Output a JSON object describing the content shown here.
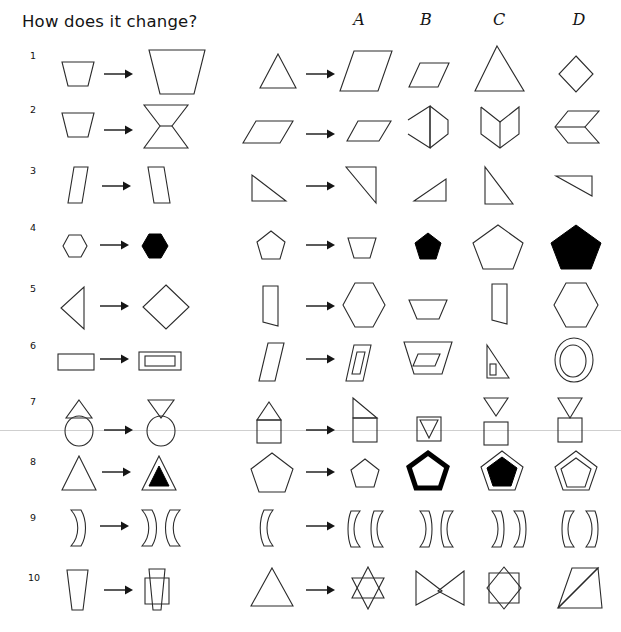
{
  "header": {
    "title": "How does it change?",
    "columns": [
      "A",
      "B",
      "C",
      "D"
    ]
  },
  "rows": [
    {
      "number": "1",
      "example": {
        "from": "small-trapezoid-narrow-top",
        "to": "large-trapezoid-narrow-top"
      },
      "question": "triangle-up",
      "options": [
        "large-parallelogram",
        "small-parallelogram",
        "tall-triangle",
        "diamond"
      ]
    },
    {
      "number": "2",
      "example": {
        "from": "trapezoid-narrow-bottom",
        "to": "hourglass-bowtie-vertical"
      },
      "question": "parallelogram-flat",
      "options": [
        "parallelogram-flat-small",
        "folded-chevron-right",
        "folded-chevron-up",
        "double-parallelogram-joined"
      ]
    },
    {
      "number": "3",
      "example": {
        "from": "leaning-parallelogram-left",
        "to": "leaning-parallelogram-right"
      },
      "question": "right-triangle-bottom-left",
      "options": [
        "right-triangle-top-left",
        "right-triangle-bottom-right",
        "right-triangle-top-left-tall",
        "right-triangle-flat-top"
      ]
    },
    {
      "number": "4",
      "example": {
        "from": "hexagon-outline-small",
        "to": "hexagon-filled-small"
      },
      "question": "pentagon-outline-small",
      "options": [
        "trapezoid-outline",
        "pentagon-filled-small",
        "pentagon-outline-large",
        "pentagon-filled-large"
      ]
    },
    {
      "number": "5",
      "example": {
        "from": "triangle-pointing-left",
        "to": "diamond"
      },
      "question": "half-hexagon-left",
      "options": [
        "hexagon-outline-large",
        "trapezoid-wide",
        "half-hexagon-right",
        "hexagon-outline-large-2"
      ]
    },
    {
      "number": "6",
      "example": {
        "from": "rectangle-outline",
        "to": "rectangle-nested"
      },
      "question": "parallelogram-tall",
      "options": [
        "parallelogram-nested",
        "trapezoid-nested",
        "triangle-with-small-inner",
        "ellipse-nested"
      ]
    },
    {
      "number": "7",
      "example": {
        "from": "triangle-over-circle",
        "to": "inverted-triangle-over-circle"
      },
      "question": "triangle-over-square-house",
      "options": [
        "half-triangle-over-square",
        "inverted-triangle-inside-square",
        "inverted-triangle-above-square-detached",
        "inverted-triangle-on-square"
      ]
    },
    {
      "number": "8",
      "example": {
        "from": "triangle-outline",
        "to": "triangle-with-filled-inner"
      },
      "question": "pentagon-outline-large",
      "options": [
        "pentagon-outline-small",
        "pentagon-thick-outline",
        "pentagon-with-filled-inner",
        "pentagon-with-nested-outline"
      ]
    },
    {
      "number": "9",
      "example": {
        "from": "single-curved-bracket-right",
        "to": "double-curved-bracket-right-left"
      },
      "question": "single-curved-bracket-left",
      "options": [
        "bracket-left-left",
        "bracket-right-left",
        "bracket-right-right",
        "bracket-left-right"
      ]
    },
    {
      "number": "10",
      "example": {
        "from": "tapered-trapezoid-vertical",
        "to": "overlapping-rectangles-cross"
      },
      "question": "triangle-up-large",
      "options": [
        "star-of-david-overlap",
        "bowtie-overlap",
        "octagram-square-overlap",
        "two-triangles-adjacent"
      ]
    }
  ],
  "decoration": {
    "stray_line_y": 430,
    "stray_line_color": "#cfcfcf"
  },
  "colors": {
    "stroke": "#2b2b2b",
    "fill": "#000000",
    "background": "#ffffff"
  }
}
